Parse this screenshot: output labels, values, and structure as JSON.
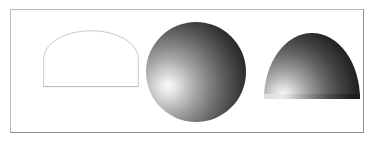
{
  "figure": {
    "caption": "",
    "background_color": "#ffffff",
    "frame": {
      "border_color_light": "#b9b9b9",
      "border_color_dark": "#8e8e8e",
      "fill_color": "#ffffff"
    },
    "shapes": [
      {
        "id": "wireframe-semicircle",
        "label": "wireframe semicircle outline",
        "render_style": "wireframe",
        "stroke_color": "#c8c8c8",
        "fill_color": "#ffffff",
        "stroke_width": "1"
      },
      {
        "id": "shaded-sphere",
        "label": "shaded sphere",
        "render_style": "smooth-shaded",
        "highlight_color": "#f7f7f7",
        "shadow_color": "#0d0d0d",
        "light_direction": "lower-left"
      },
      {
        "id": "shaded-hemisphere",
        "label": "shaded hemisphere dome",
        "render_style": "smooth-shaded",
        "highlight_color": "#fbfbfb",
        "shadow_color": "#0c0c0c",
        "light_direction": "lower-left"
      }
    ]
  }
}
